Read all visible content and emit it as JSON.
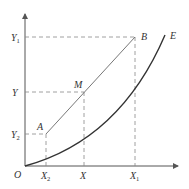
{
  "diagram": {
    "origin_label": "O",
    "x_ticks": [
      {
        "label": "X",
        "sub": "2",
        "x": 46
      },
      {
        "label": "X",
        "sub": "",
        "x": 84
      },
      {
        "label": "X",
        "sub": "1",
        "x": 135
      }
    ],
    "y_ticks": [
      {
        "label": "Y",
        "sub": "1",
        "y": 37
      },
      {
        "label": "Y",
        "sub": "",
        "y": 92
      },
      {
        "label": "Y",
        "sub": "2",
        "y": 134
      }
    ],
    "points": {
      "A": {
        "label": "A",
        "x": 46,
        "y": 134
      },
      "M": {
        "label": "M",
        "x": 84,
        "y": 92
      },
      "B": {
        "label": "B",
        "x": 135,
        "y": 37
      },
      "E": {
        "label": "E",
        "x": 165,
        "y": 35
      }
    },
    "colors": {
      "axis": "#555555",
      "line": "#777777",
      "curve": "#333333",
      "dash": "#888888"
    }
  }
}
